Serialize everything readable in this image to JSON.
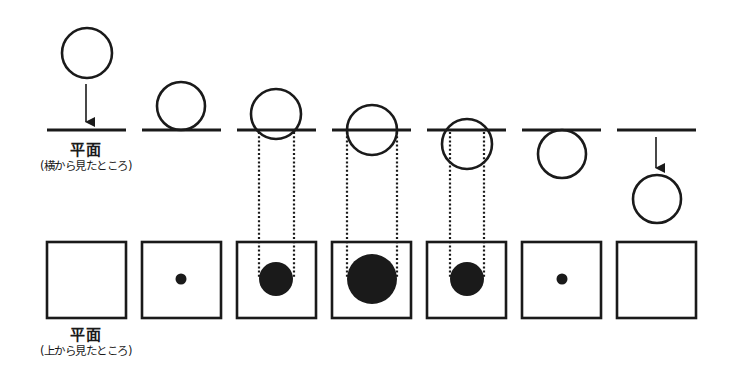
{
  "labels": {
    "side_view": {
      "main": "平面",
      "sub": "(横から見たところ)"
    },
    "top_view": {
      "main": "平面",
      "sub": "(上から見たところ)"
    }
  },
  "colors": {
    "stroke": "#1a1a1a",
    "fill": "#1a1a1a",
    "background": "#ffffff"
  },
  "plane_y": 130,
  "square": {
    "top": 242,
    "size": 78
  },
  "panels": [
    {
      "index": 1,
      "plane_x1": 47,
      "plane_x2": 126,
      "sphere_cx": 87,
      "sphere_cy": 53,
      "sphere_r": 25,
      "arrow": {
        "x": 86,
        "y1": 84,
        "y2": 122
      },
      "section_r": 0,
      "dotted": false,
      "state": "above-approaching"
    },
    {
      "index": 2,
      "plane_x1": 142,
      "plane_x2": 221,
      "sphere_cx": 181,
      "sphere_cy": 106,
      "sphere_r": 24,
      "arrow": null,
      "section_r": 5.5,
      "dotted": false,
      "state": "touching-top"
    },
    {
      "index": 3,
      "plane_x1": 237,
      "plane_x2": 316,
      "sphere_cx": 276,
      "sphere_cy": 114,
      "sphere_r": 25,
      "arrow": null,
      "section_r": 17,
      "dotted": true,
      "dot_x1": 259,
      "dot_x2": 294,
      "state": "partly-through"
    },
    {
      "index": 4,
      "plane_x1": 332,
      "plane_x2": 411,
      "sphere_cx": 372,
      "sphere_cy": 130,
      "sphere_r": 25,
      "arrow": null,
      "section_r": 25,
      "dotted": true,
      "dot_x1": 347,
      "dot_x2": 397,
      "state": "center-on-plane"
    },
    {
      "index": 5,
      "plane_x1": 427,
      "plane_x2": 506,
      "sphere_cx": 467,
      "sphere_cy": 144,
      "sphere_r": 25,
      "arrow": null,
      "section_r": 17,
      "dotted": true,
      "dot_x1": 450,
      "dot_x2": 484,
      "state": "partly-below"
    },
    {
      "index": 6,
      "plane_x1": 522,
      "plane_x2": 601,
      "sphere_cx": 562,
      "sphere_cy": 154,
      "sphere_r": 24,
      "arrow": null,
      "section_r": 5.5,
      "dotted": false,
      "state": "touching-bottom"
    },
    {
      "index": 7,
      "plane_x1": 617,
      "plane_x2": 696,
      "sphere_cx": 657,
      "sphere_cy": 199,
      "sphere_r": 24,
      "arrow": {
        "x": 656,
        "y1": 137,
        "y2": 168
      },
      "section_r": 0,
      "dotted": false,
      "state": "below-departing"
    }
  ]
}
